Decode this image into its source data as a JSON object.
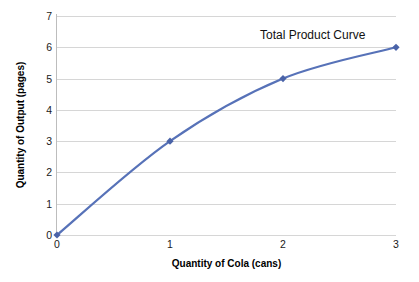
{
  "chart_data": {
    "type": "line",
    "title": "",
    "annotation": "Total Product Curve",
    "xlabel": "Quantity of Cola (cans)",
    "ylabel": "Quantity of Output (pages)",
    "x": [
      0,
      1,
      2,
      3
    ],
    "values": [
      0,
      3,
      5,
      6
    ],
    "series": [
      {
        "name": "Total Product Curve",
        "values": [
          0,
          3,
          5,
          6
        ]
      }
    ],
    "xlim": [
      0,
      3
    ],
    "ylim": [
      0,
      7
    ],
    "xticks": [
      "0",
      "1",
      "2",
      "3"
    ],
    "yticks": [
      "0",
      "1",
      "2",
      "3",
      "4",
      "5",
      "6",
      "7"
    ],
    "grid": "horizontal",
    "legend": "none",
    "marker": "diamond",
    "colors": {
      "line": "#5772b8",
      "marker": "#4a63a8",
      "gridline": "#d6d6d6",
      "axis": "#bdbdbd",
      "text": "#111111",
      "background": "#ffffff"
    }
  }
}
